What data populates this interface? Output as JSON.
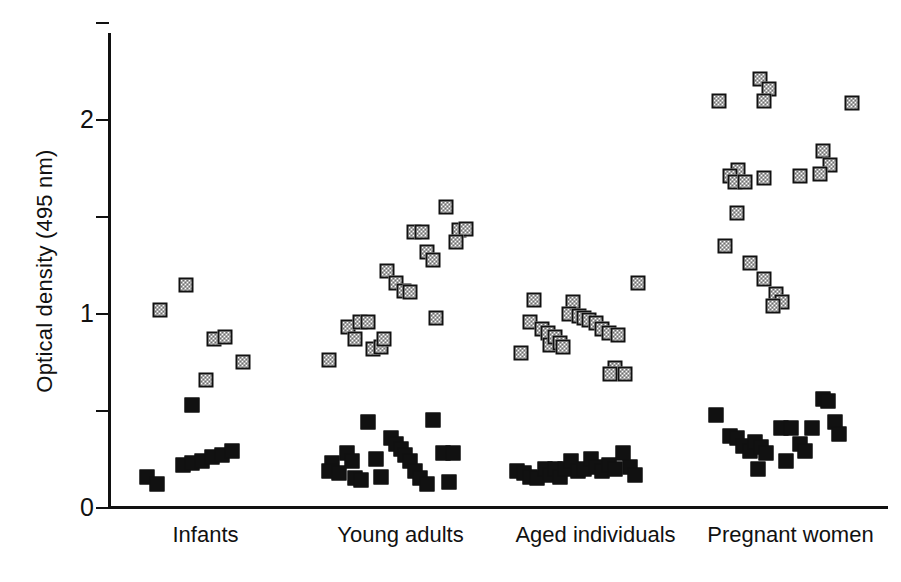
{
  "chart_data": {
    "type": "scatter",
    "title": "",
    "xlabel": "",
    "ylabel": "Optical density (495 nm)",
    "ylim": [
      0,
      2.5
    ],
    "yticks": [
      0,
      0.5,
      1,
      1.5,
      2,
      2.5
    ],
    "ytick_labels": [
      "0",
      "",
      "1",
      "",
      "2",
      ""
    ],
    "grid": false,
    "legend": "none",
    "categories": [
      "Infants",
      "Young adults",
      "Aged individuals",
      "Pregnant women"
    ],
    "series": [
      {
        "name": "hatched-marker-series",
        "marker": "hatched-square",
        "groups": [
          {
            "category": "Infants",
            "points": [
              {
                "x": 0.22,
                "y": 1.02
              },
              {
                "x": 0.38,
                "y": 1.15
              },
              {
                "x": 0.55,
                "y": 0.87
              },
              {
                "x": 0.62,
                "y": 0.88
              },
              {
                "x": 0.73,
                "y": 0.75
              },
              {
                "x": 0.5,
                "y": 0.66
              }
            ]
          },
          {
            "category": "Young adults",
            "points": [
              {
                "x": 0.06,
                "y": 0.76
              },
              {
                "x": 0.18,
                "y": 0.93
              },
              {
                "x": 0.22,
                "y": 0.87
              },
              {
                "x": 0.25,
                "y": 0.96
              },
              {
                "x": 0.3,
                "y": 0.96
              },
              {
                "x": 0.33,
                "y": 0.82
              },
              {
                "x": 0.38,
                "y": 0.83
              },
              {
                "x": 0.4,
                "y": 0.87
              },
              {
                "x": 0.42,
                "y": 1.22
              },
              {
                "x": 0.47,
                "y": 1.16
              },
              {
                "x": 0.52,
                "y": 1.12
              },
              {
                "x": 0.56,
                "y": 1.11
              },
              {
                "x": 0.58,
                "y": 1.42
              },
              {
                "x": 0.63,
                "y": 1.42
              },
              {
                "x": 0.66,
                "y": 1.32
              },
              {
                "x": 0.7,
                "y": 1.28
              },
              {
                "x": 0.72,
                "y": 0.98
              },
              {
                "x": 0.78,
                "y": 1.55
              },
              {
                "x": 0.86,
                "y": 1.43
              },
              {
                "x": 0.9,
                "y": 1.44
              },
              {
                "x": 0.84,
                "y": 1.37
              }
            ]
          },
          {
            "category": "Aged individuals",
            "points": [
              {
                "x": 0.04,
                "y": 0.8
              },
              {
                "x": 0.12,
                "y": 1.07
              },
              {
                "x": 0.1,
                "y": 0.96
              },
              {
                "x": 0.17,
                "y": 0.92
              },
              {
                "x": 0.21,
                "y": 0.9
              },
              {
                "x": 0.22,
                "y": 0.84
              },
              {
                "x": 0.25,
                "y": 0.88
              },
              {
                "x": 0.28,
                "y": 0.85
              },
              {
                "x": 0.3,
                "y": 0.83
              },
              {
                "x": 0.36,
                "y": 1.06
              },
              {
                "x": 0.34,
                "y": 1.0
              },
              {
                "x": 0.4,
                "y": 0.99
              },
              {
                "x": 0.43,
                "y": 0.98
              },
              {
                "x": 0.46,
                "y": 0.97
              },
              {
                "x": 0.5,
                "y": 0.95
              },
              {
                "x": 0.54,
                "y": 0.92
              },
              {
                "x": 0.58,
                "y": 0.9
              },
              {
                "x": 0.64,
                "y": 0.89
              },
              {
                "x": 0.62,
                "y": 0.72
              },
              {
                "x": 0.59,
                "y": 0.69
              },
              {
                "x": 0.68,
                "y": 0.69
              },
              {
                "x": 0.76,
                "y": 1.16
              }
            ]
          },
          {
            "category": "Pregnant women",
            "points": [
              {
                "x": 0.06,
                "y": 2.1
              },
              {
                "x": 0.31,
                "y": 2.21
              },
              {
                "x": 0.37,
                "y": 2.16
              },
              {
                "x": 0.34,
                "y": 2.1
              },
              {
                "x": 0.88,
                "y": 2.09
              },
              {
                "x": 0.18,
                "y": 1.74
              },
              {
                "x": 0.13,
                "y": 1.71
              },
              {
                "x": 0.16,
                "y": 1.68
              },
              {
                "x": 0.22,
                "y": 1.68
              },
              {
                "x": 0.34,
                "y": 1.7
              },
              {
                "x": 0.56,
                "y": 1.71
              },
              {
                "x": 0.7,
                "y": 1.84
              },
              {
                "x": 0.74,
                "y": 1.77
              },
              {
                "x": 0.68,
                "y": 1.72
              },
              {
                "x": 0.17,
                "y": 1.52
              },
              {
                "x": 0.1,
                "y": 1.35
              },
              {
                "x": 0.25,
                "y": 1.26
              },
              {
                "x": 0.34,
                "y": 1.18
              },
              {
                "x": 0.41,
                "y": 1.1
              },
              {
                "x": 0.45,
                "y": 1.06
              },
              {
                "x": 0.39,
                "y": 1.04
              }
            ]
          }
        ]
      },
      {
        "name": "filled-marker-series",
        "marker": "filled-square",
        "groups": [
          {
            "category": "Infants",
            "points": [
              {
                "x": 0.42,
                "y": 0.53
              },
              {
                "x": 0.14,
                "y": 0.16
              },
              {
                "x": 0.2,
                "y": 0.12
              },
              {
                "x": 0.36,
                "y": 0.22
              },
              {
                "x": 0.42,
                "y": 0.23
              },
              {
                "x": 0.48,
                "y": 0.24
              },
              {
                "x": 0.54,
                "y": 0.26
              },
              {
                "x": 0.6,
                "y": 0.27
              },
              {
                "x": 0.66,
                "y": 0.29
              }
            ]
          },
          {
            "category": "Young adults",
            "points": [
              {
                "x": 0.08,
                "y": 0.23
              },
              {
                "x": 0.06,
                "y": 0.19
              },
              {
                "x": 0.12,
                "y": 0.18
              },
              {
                "x": 0.17,
                "y": 0.28
              },
              {
                "x": 0.2,
                "y": 0.24
              },
              {
                "x": 0.22,
                "y": 0.15
              },
              {
                "x": 0.26,
                "y": 0.14
              },
              {
                "x": 0.3,
                "y": 0.44
              },
              {
                "x": 0.35,
                "y": 0.25
              },
              {
                "x": 0.38,
                "y": 0.16
              },
              {
                "x": 0.44,
                "y": 0.36
              },
              {
                "x": 0.47,
                "y": 0.33
              },
              {
                "x": 0.5,
                "y": 0.3
              },
              {
                "x": 0.53,
                "y": 0.27
              },
              {
                "x": 0.56,
                "y": 0.24
              },
              {
                "x": 0.59,
                "y": 0.19
              },
              {
                "x": 0.62,
                "y": 0.15
              },
              {
                "x": 0.66,
                "y": 0.12
              },
              {
                "x": 0.7,
                "y": 0.45
              },
              {
                "x": 0.76,
                "y": 0.28
              },
              {
                "x": 0.82,
                "y": 0.28
              },
              {
                "x": 0.8,
                "y": 0.13
              }
            ]
          },
          {
            "category": "Aged individuals",
            "points": [
              {
                "x": 0.02,
                "y": 0.19
              },
              {
                "x": 0.06,
                "y": 0.18
              },
              {
                "x": 0.1,
                "y": 0.16
              },
              {
                "x": 0.14,
                "y": 0.15
              },
              {
                "x": 0.19,
                "y": 0.2
              },
              {
                "x": 0.22,
                "y": 0.17
              },
              {
                "x": 0.25,
                "y": 0.2
              },
              {
                "x": 0.28,
                "y": 0.16
              },
              {
                "x": 0.31,
                "y": 0.2
              },
              {
                "x": 0.35,
                "y": 0.24
              },
              {
                "x": 0.39,
                "y": 0.19
              },
              {
                "x": 0.43,
                "y": 0.2
              },
              {
                "x": 0.47,
                "y": 0.25
              },
              {
                "x": 0.5,
                "y": 0.21
              },
              {
                "x": 0.54,
                "y": 0.19
              },
              {
                "x": 0.58,
                "y": 0.22
              },
              {
                "x": 0.62,
                "y": 0.2
              },
              {
                "x": 0.67,
                "y": 0.28
              },
              {
                "x": 0.71,
                "y": 0.21
              },
              {
                "x": 0.74,
                "y": 0.17
              }
            ]
          },
          {
            "category": "Pregnant women",
            "points": [
              {
                "x": 0.04,
                "y": 0.48
              },
              {
                "x": 0.13,
                "y": 0.37
              },
              {
                "x": 0.17,
                "y": 0.36
              },
              {
                "x": 0.21,
                "y": 0.32
              },
              {
                "x": 0.25,
                "y": 0.29
              },
              {
                "x": 0.28,
                "y": 0.34
              },
              {
                "x": 0.32,
                "y": 0.31
              },
              {
                "x": 0.35,
                "y": 0.28
              },
              {
                "x": 0.3,
                "y": 0.2
              },
              {
                "x": 0.44,
                "y": 0.41
              },
              {
                "x": 0.5,
                "y": 0.41
              },
              {
                "x": 0.47,
                "y": 0.24
              },
              {
                "x": 0.56,
                "y": 0.33
              },
              {
                "x": 0.59,
                "y": 0.29
              },
              {
                "x": 0.63,
                "y": 0.41
              },
              {
                "x": 0.7,
                "y": 0.56
              },
              {
                "x": 0.73,
                "y": 0.55
              },
              {
                "x": 0.77,
                "y": 0.44
              },
              {
                "x": 0.8,
                "y": 0.38
              }
            ]
          }
        ]
      }
    ]
  },
  "axis": {
    "y_title": "Optical density (495 nm)",
    "y_labels": [
      {
        "value": 0,
        "text": "0"
      },
      {
        "value": 1,
        "text": "1"
      },
      {
        "value": 2,
        "text": "2"
      }
    ]
  },
  "x_labels": [
    {
      "text": "Infants"
    },
    {
      "text": "Young adults"
    },
    {
      "text": "Aged individuals"
    },
    {
      "text": "Pregnant women"
    }
  ]
}
